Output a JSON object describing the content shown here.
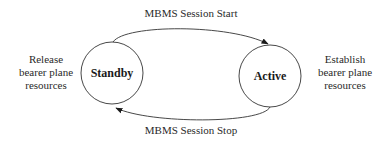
{
  "diagram": {
    "type": "state-transition",
    "states": [
      {
        "id": "standby",
        "label": "Standby",
        "side_note": [
          "Release",
          "bearer plane",
          "resources"
        ]
      },
      {
        "id": "active",
        "label": "Active",
        "side_note": [
          "Establish",
          "bearer plane",
          "resources"
        ]
      }
    ],
    "transitions": [
      {
        "from": "standby",
        "to": "active",
        "label": "MBMS Session Start"
      },
      {
        "from": "active",
        "to": "standby",
        "label": "MBMS Session Stop"
      }
    ],
    "colors": {
      "stroke": "#333333",
      "text": "#2a2a2a",
      "background": "#ffffff"
    }
  }
}
